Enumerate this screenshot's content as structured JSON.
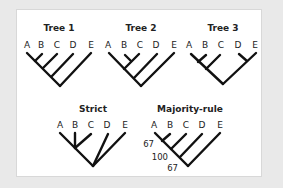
{
  "figure": {
    "background_color": "#e9e9e9",
    "panel_color": "#ffffff",
    "line_color": "#111111"
  },
  "trees": [
    {
      "title": "Tree 1",
      "leaves": [
        "A",
        "B",
        "C",
        "D",
        "E"
      ],
      "topology": "((((A,B),C),D),E)"
    },
    {
      "title": "Tree 2",
      "leaves": [
        "A",
        "B",
        "C",
        "D",
        "E"
      ],
      "topology": "(((A,(B,C)),D),E)"
    },
    {
      "title": "Tree 3",
      "leaves": [
        "A",
        "B",
        "C",
        "D",
        "E"
      ],
      "topology": "(((A,B),C),(D,E))"
    },
    {
      "title": "Strict",
      "leaves": [
        "A",
        "B",
        "C",
        "D",
        "E"
      ],
      "topology": "((A,B,C),D,E)"
    },
    {
      "title": "Majority-rule",
      "leaves": [
        "A",
        "B",
        "C",
        "D",
        "E"
      ],
      "topology": "((((A,B),C),D),E)",
      "support_values": [
        "67",
        "100",
        "67"
      ]
    }
  ]
}
